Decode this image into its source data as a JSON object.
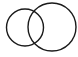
{
  "diagram": {
    "type": "venn",
    "background": "#ffffff",
    "stroke_color": "#1a1a1a",
    "stroke_width": 1.4,
    "circles": [
      {
        "name": "left-circle",
        "cx": 25,
        "cy": 27.5,
        "r": 18.5
      },
      {
        "name": "right-circle",
        "cx": 52,
        "cy": 27,
        "r": 24
      }
    ]
  }
}
